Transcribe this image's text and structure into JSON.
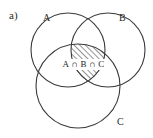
{
  "figure": {
    "part_label": "a)",
    "set_labels": {
      "a": "A",
      "b": "B",
      "c": "C"
    },
    "shaded_region_label": "A ∩ B ∩ C",
    "colors": {
      "stroke": "#3a3a3a",
      "hatch": "#3a3a3a",
      "background": "#ffffff",
      "text": "#2b2b2b"
    },
    "diagram": {
      "type": "venn-3-set",
      "circles": [
        {
          "set": "A",
          "cx": 68,
          "cy": 50,
          "r": 37
        },
        {
          "set": "B",
          "cx": 108,
          "cy": 50,
          "r": 37
        },
        {
          "set": "C",
          "cx": 78,
          "cy": 86,
          "r": 42
        }
      ],
      "shading": {
        "region": "A ∩ B ∩ C",
        "pattern": "diagonal-hatch",
        "direction": "bottom-left-to-top-right"
      }
    }
  }
}
